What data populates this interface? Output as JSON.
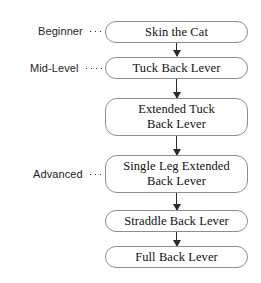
{
  "diagram": {
    "type": "vertical-flowchart",
    "colors": {
      "background": "#ffffff",
      "node_border": "#8e8e8e",
      "node_fill": "#ffffff",
      "arrow": "#2b2b2b",
      "text": "#111111",
      "label_text": "#1d1d1d"
    },
    "levels": [
      {
        "label": "Beginner",
        "target_node": 0
      },
      {
        "label": "Mid-Level",
        "target_node": 1
      },
      {
        "label": "Advanced",
        "target_node": 3
      }
    ],
    "nodes": [
      {
        "label": "Skin the Cat",
        "lines": 1
      },
      {
        "label": "Tuck Back Lever",
        "lines": 1
      },
      {
        "label": "Extended Tuck\nBack Lever",
        "lines": 2
      },
      {
        "label": "Single Leg Extended\nBack Lever",
        "lines": 2
      },
      {
        "label": "Straddle Back Lever",
        "lines": 1
      },
      {
        "label": "Full Back Lever",
        "lines": 1
      }
    ],
    "connectors": [
      {
        "from": 0,
        "to": 1
      },
      {
        "from": 1,
        "to": 2
      },
      {
        "from": 2,
        "to": 3
      },
      {
        "from": 3,
        "to": 4
      },
      {
        "from": 4,
        "to": 5
      }
    ]
  }
}
